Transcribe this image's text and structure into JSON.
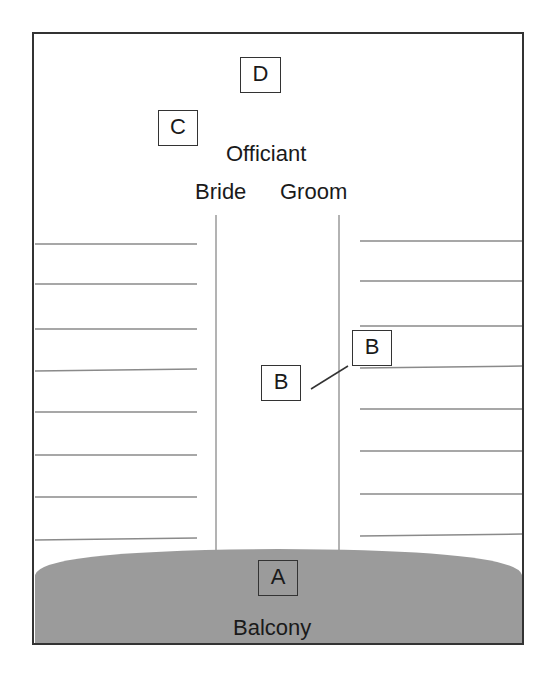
{
  "diagram": {
    "colors": {
      "border": "#333333",
      "pew_line": "#8a8a8a",
      "aisle_line": "#9a9a9a",
      "balcony_fill": "#9b9b9b",
      "text": "#1a1a1a",
      "background": "#ffffff"
    },
    "labels": {
      "officiant": "Officiant",
      "bride": "Bride",
      "groom": "Groom",
      "balcony": "Balcony"
    },
    "markers": [
      {
        "id": "D",
        "label": "D",
        "position": "behind officiant"
      },
      {
        "id": "C",
        "label": "C",
        "position": "front left near bride"
      },
      {
        "id": "B1",
        "label": "B",
        "position": "in center aisle"
      },
      {
        "id": "B2",
        "label": "B",
        "position": "end of right pews, aisle side"
      },
      {
        "id": "A",
        "label": "A",
        "position": "balcony"
      }
    ],
    "pews": {
      "left_rows": 8,
      "right_rows": 8
    }
  }
}
